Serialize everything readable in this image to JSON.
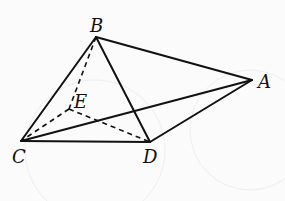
{
  "figure": {
    "points": [
      {
        "id": "A",
        "label": "A"
      },
      {
        "id": "B",
        "label": "B"
      },
      {
        "id": "C",
        "label": "C"
      },
      {
        "id": "D",
        "label": "D"
      },
      {
        "id": "E",
        "label": "E"
      }
    ],
    "edges": [
      {
        "from": "B",
        "to": "C",
        "style": "solid"
      },
      {
        "from": "B",
        "to": "A",
        "style": "solid"
      },
      {
        "from": "B",
        "to": "D",
        "style": "solid"
      },
      {
        "from": "C",
        "to": "D",
        "style": "solid"
      },
      {
        "from": "C",
        "to": "A",
        "style": "solid"
      },
      {
        "from": "D",
        "to": "A",
        "style": "solid"
      },
      {
        "from": "B",
        "to": "E",
        "style": "dashed"
      },
      {
        "from": "E",
        "to": "C",
        "style": "dashed"
      },
      {
        "from": "E",
        "to": "D",
        "style": "dashed"
      }
    ],
    "colors": {
      "line": "#111111",
      "background": "#fbfbfb"
    }
  }
}
